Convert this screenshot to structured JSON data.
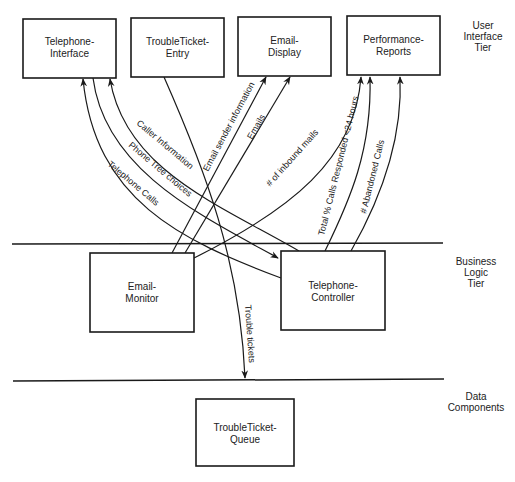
{
  "tiers": {
    "ui": {
      "line1": "User",
      "line2": "Interface",
      "line3": "Tier"
    },
    "business": {
      "line1": "Business",
      "line2": "Logic",
      "line3": "Tier"
    },
    "data": {
      "line1": "Data",
      "line2": "Components"
    }
  },
  "components": {
    "telephone_interface": {
      "line1": "Telephone-",
      "line2": "Interface"
    },
    "troubleticket_entry": {
      "line1": "TroubleTicket-",
      "line2": "Entry"
    },
    "email_display": {
      "line1": "Email-",
      "line2": "Display"
    },
    "performance_reports": {
      "line1": "Performance-",
      "line2": "Reports"
    },
    "email_monitor": {
      "line1": "Email-",
      "line2": "Monitor"
    },
    "telephone_controller": {
      "line1": "Telephone-",
      "line2": "Controller"
    },
    "troubleticket_queue": {
      "line1": "TroubleTicket-",
      "line2": "Queue"
    }
  },
  "flows": {
    "caller_information": "Caller Information",
    "phone_tree_choices": "Phone Tree choices",
    "telephone_calls": "Telephone Calls",
    "email_sender_information": "Email sender information",
    "emails": "Emails",
    "inbound_mails": "# of inbound mails",
    "calls_responded": "Total % Calls Responded <24 hours",
    "abandoned_calls": "# Abandoned Calls",
    "trouble_tickets": "Trouble tickets"
  }
}
